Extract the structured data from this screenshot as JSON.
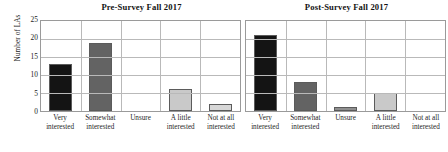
{
  "chart_data": [
    {
      "type": "bar",
      "title": "Pre-Survey Fall 2017",
      "xlabel": "",
      "ylabel": "Number of LAs",
      "categories": [
        "Very interested",
        "Somewhat interested",
        "Unsure",
        "A little interested",
        "Not at all interested"
      ],
      "category_lines": [
        [
          "Very",
          "interested"
        ],
        [
          "Somewhat",
          "interested"
        ],
        [
          "Unsure",
          ""
        ],
        [
          "A little",
          "interested"
        ],
        [
          "Not at all",
          "interested"
        ]
      ],
      "values": [
        13,
        19,
        0,
        6,
        2
      ],
      "bar_colors": [
        "#141414",
        "#636363",
        "#c9c9c9",
        "#c9c9c9",
        "#d7d7d7"
      ],
      "ylim": [
        0,
        25
      ],
      "yticks": [
        25,
        20,
        15,
        10,
        5,
        0
      ],
      "grid": true,
      "legend": "none"
    },
    {
      "type": "bar",
      "title": "Post-Survey Fall 2017",
      "xlabel": "",
      "ylabel": "Number of LAs",
      "categories": [
        "Very interested",
        "Somewhat interested",
        "Unsure",
        "A little interested",
        "Not at all interested"
      ],
      "category_lines": [
        [
          "Very",
          "interested"
        ],
        [
          "Somewhat",
          "interested"
        ],
        [
          "Unsure",
          ""
        ],
        [
          "A little",
          "interested"
        ],
        [
          "Not at all",
          "interested"
        ]
      ],
      "values": [
        21,
        8,
        1,
        5,
        0
      ],
      "bar_colors": [
        "#141414",
        "#636363",
        "#8f8f8f",
        "#c9c9c9",
        "#d7d7d7"
      ],
      "ylim": [
        0,
        25
      ],
      "yticks": [
        25,
        20,
        15,
        10,
        5,
        0
      ],
      "grid": true,
      "legend": "none"
    }
  ],
  "axis": {
    "ylabel": "Number of LAs",
    "yticks": [
      "25",
      "20",
      "15",
      "10",
      "5",
      "0"
    ]
  },
  "panels": {
    "left_title": "Pre-Survey Fall 2017",
    "right_title": "Post-Survey Fall 2017"
  }
}
